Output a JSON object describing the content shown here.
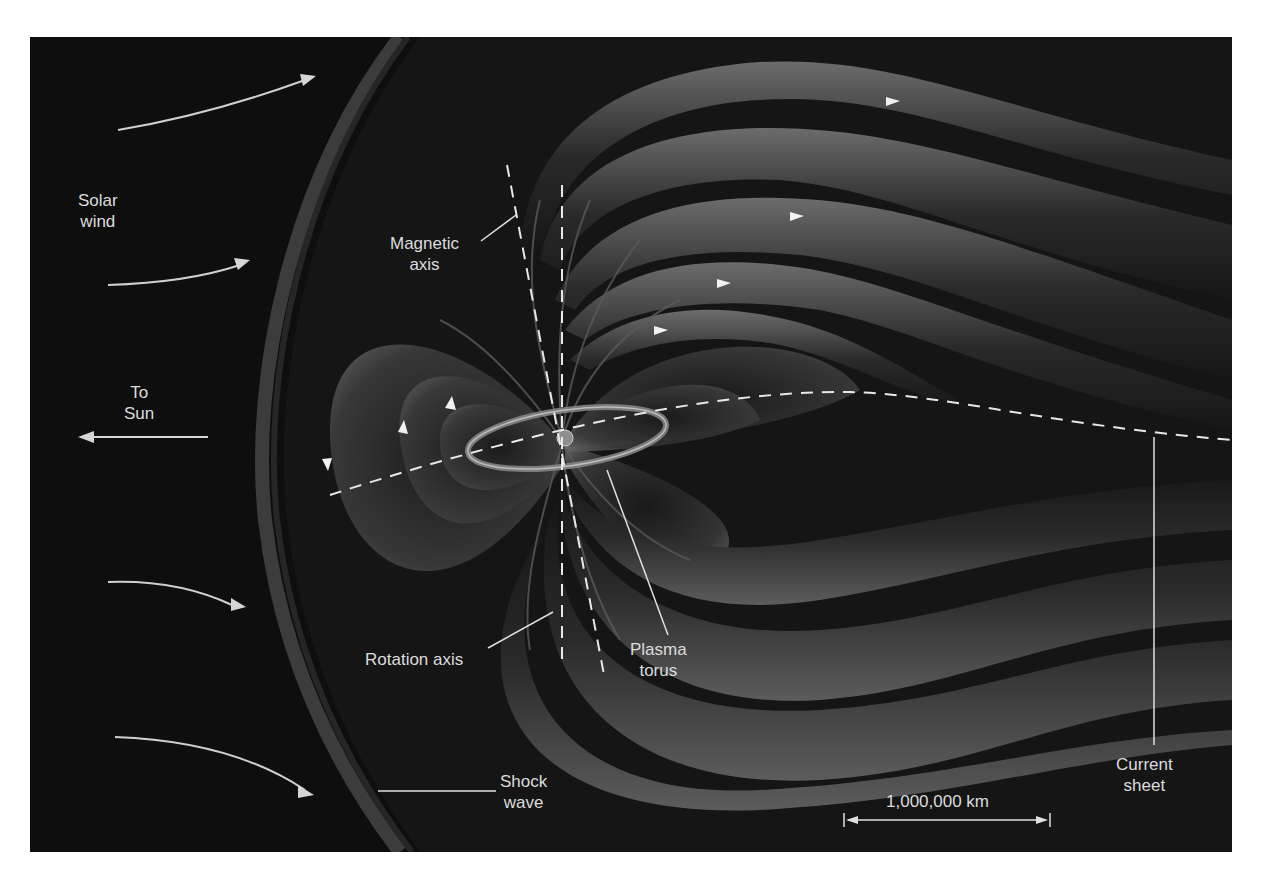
{
  "diagram": {
    "colors": {
      "background": "#0e0e0e",
      "field_lobe_light": "#6a6a6a",
      "field_lobe_dark": "#1c1c1c",
      "label_text": "#dcdcdc",
      "guide_lines": "#e6e6e6"
    },
    "labels": {
      "solar_wind": [
        "Solar",
        "wind"
      ],
      "to_sun": [
        "To",
        "Sun"
      ],
      "magnetic_axis": [
        "Magnetic",
        "axis"
      ],
      "rotation_axis": "Rotation axis",
      "plasma_torus": [
        "Plasma",
        "torus"
      ],
      "shock_wave": [
        "Shock",
        "wave"
      ],
      "current_sheet": [
        "Current",
        "sheet"
      ],
      "scale_bar": "1,000,000 km"
    },
    "icons": {
      "solar_wind_arrows": 5,
      "to_sun_arrow": "left-arrow",
      "field_direction_arrowheads": 9,
      "scale_bar_arrows": "double-headed"
    }
  }
}
